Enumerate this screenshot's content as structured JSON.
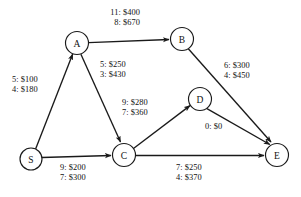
{
  "diagram": {
    "background_color": "#ffffff",
    "stroke_color": "#1a1a1a",
    "nodes": [
      {
        "id": "S",
        "label": "S",
        "cx": 31,
        "cy": 159,
        "r": 11
      },
      {
        "id": "A",
        "label": "A",
        "cx": 77,
        "cy": 43,
        "r": 11.5
      },
      {
        "id": "B",
        "label": "B",
        "cx": 182,
        "cy": 39,
        "r": 11.5
      },
      {
        "id": "C",
        "label": "C",
        "cx": 124,
        "cy": 155,
        "r": 11.5
      },
      {
        "id": "D",
        "label": "D",
        "cx": 200,
        "cy": 99,
        "r": 11.5
      },
      {
        "id": "E",
        "label": "E",
        "cx": 277,
        "cy": 155,
        "r": 11.5
      }
    ],
    "edges": [
      {
        "id": "S-A",
        "from": "S",
        "to": "A",
        "lines": [
          "5: $100",
          "4: $180"
        ],
        "align": "left",
        "label_x": 12,
        "label_y": 75
      },
      {
        "id": "A-B",
        "from": "A",
        "to": "B",
        "lines": [
          "11: $400",
          "8: $670"
        ],
        "align": "right",
        "label_x": 96,
        "label_y": 8
      },
      {
        "id": "A-C",
        "from": "A",
        "to": "C",
        "lines": [
          "5: $250",
          "3: $430"
        ],
        "align": "left",
        "label_x": 100,
        "label_y": 60
      },
      {
        "id": "B-E",
        "from": "B",
        "to": "E",
        "lines": [
          "6: $300",
          "4: $450"
        ],
        "align": "left",
        "label_x": 224,
        "label_y": 61
      },
      {
        "id": "C-D",
        "from": "C",
        "to": "D",
        "lines": [
          "9: $280",
          "7: $360"
        ],
        "align": "left",
        "label_x": 122,
        "label_y": 98
      },
      {
        "id": "D-E",
        "from": "D",
        "to": "E",
        "lines": [
          "0: $0"
        ],
        "align": "left",
        "label_x": 205,
        "label_y": 122
      },
      {
        "id": "S-C",
        "from": "S",
        "to": "C",
        "lines": [
          "9: $200",
          "7: $300"
        ],
        "align": "left",
        "label_x": 60,
        "label_y": 163
      },
      {
        "id": "C-E",
        "from": "C",
        "to": "E",
        "lines": [
          "7: $250",
          "4: $370"
        ],
        "align": "left",
        "label_x": 176,
        "label_y": 163
      }
    ]
  }
}
